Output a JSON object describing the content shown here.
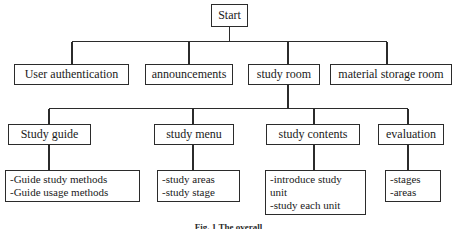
{
  "diagram": {
    "title_caption": "Fig. 1 The overall",
    "caption_visible_partial": true,
    "line_color": "#2b2b2b",
    "background_color": "#ffffff",
    "text_color": "#1a1a1a",
    "levels": {
      "root": {
        "label": "Start"
      },
      "level2": [
        {
          "label": "User authentication"
        },
        {
          "label": "announcements"
        },
        {
          "label": "study room"
        },
        {
          "label": "material storage room"
        }
      ],
      "level3": [
        {
          "label": "Study guide"
        },
        {
          "label": "study menu"
        },
        {
          "label": "study contents"
        },
        {
          "label": "evaluation"
        }
      ],
      "level4": [
        {
          "parent": "Study guide",
          "lines": [
            "-Guide study methods",
            "-Guide usage methods"
          ]
        },
        {
          "parent": "study menu",
          "lines": [
            "-study areas",
            "-study stage"
          ]
        },
        {
          "parent": "study contents",
          "lines": [
            "-introduce study",
            "unit",
            "-study each unit"
          ]
        },
        {
          "parent": "evaluation",
          "lines": [
            "-stages",
            "-areas"
          ]
        }
      ]
    }
  }
}
